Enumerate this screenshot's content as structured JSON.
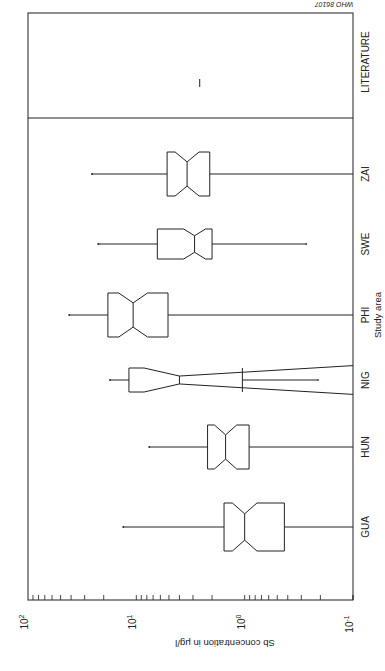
{
  "figure_id": "WHO 86107",
  "chart_data": {
    "type": "boxplot",
    "orientation": "rotated 90 degrees (value axis horizontal, reversed; categories vertical); all text upside down",
    "title": "",
    "xlabel": "Study area",
    "ylabel": "Sb concentration in μg/l",
    "yscale": "log",
    "ylim": [
      0.1,
      100
    ],
    "tick_labels": [
      "10^2",
      "10^1",
      "10^0",
      "10^-1"
    ],
    "tick_values": [
      100,
      10,
      1,
      0.1
    ],
    "categories": [
      "GUA",
      "HUN",
      "NIG",
      "PHI",
      "SWE",
      "ZAI",
      "LITERATURE"
    ],
    "notched": true,
    "series": [
      {
        "name": "GUA",
        "whisker_high": 13.2,
        "q3": 1.55,
        "median": 1.0,
        "q1": 0.43,
        "whisker_low": 0.1
      },
      {
        "name": "HUN",
        "whisker_high": 7.6,
        "q3": 2.2,
        "median": 1.5,
        "q1": 0.91,
        "whisker_low": 0.1
      },
      {
        "name": "NIG",
        "whisker_high": 17.5,
        "q3": 11.7,
        "median": 4.0,
        "q1": 1.05,
        "whisker_low": 0.21,
        "notch_extends_beyond_box": true
      },
      {
        "name": "PHI",
        "whisker_high": 41.7,
        "q3": 18.3,
        "median": 10.7,
        "q1": 5.1,
        "whisker_low": 0.1
      },
      {
        "name": "SWE",
        "whisker_high": 22.5,
        "q3": 6.4,
        "median": 2.9,
        "q1": 2.0,
        "whisker_low": 0.27
      },
      {
        "name": "ZAI",
        "whisker_high": 25.7,
        "q3": 5.2,
        "median": 3.4,
        "q1": 2.1,
        "whisker_low": 0.1
      },
      {
        "name": "LITERATURE",
        "value": 2.6,
        "single_value": true
      }
    ],
    "separator_after": "ZAI",
    "grid": false,
    "legend": null
  },
  "labels": {
    "axis_value": "Sb concentration in μg/l",
    "axis_category": "Study area",
    "tick_100": "10",
    "tick_100_exp": "2",
    "tick_10": "10",
    "tick_10_exp": "1",
    "tick_1": "10",
    "tick_1_exp": "0",
    "tick_01": "10",
    "tick_01_exp": "-1",
    "cat_gua": "GUA",
    "cat_hun": "HUN",
    "cat_nig": "NIG",
    "cat_phi": "PHI",
    "cat_swe": "SWE",
    "cat_zai": "ZAI",
    "cat_lit": "LITERATURE"
  }
}
